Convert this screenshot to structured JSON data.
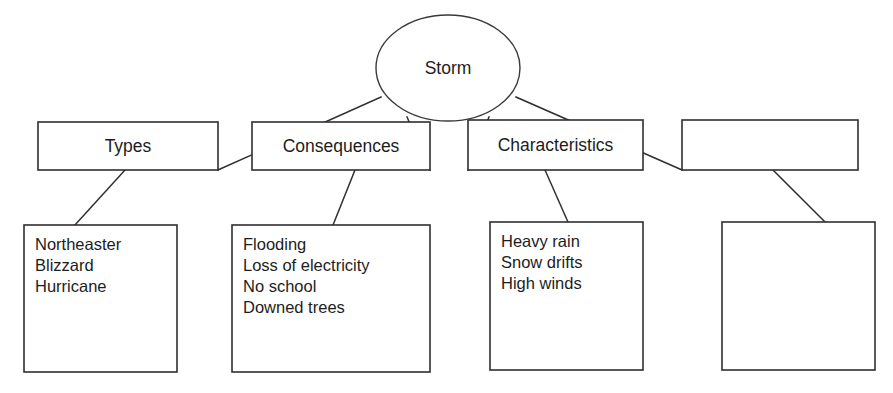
{
  "diagram": {
    "type": "concept-map",
    "title_node": {
      "label": "Storm",
      "shape": "ellipse",
      "cx": 448,
      "cy": 68,
      "rx": 72,
      "ry": 53
    },
    "category_boxes": [
      {
        "label": "Types",
        "x": 38,
        "y": 122,
        "w": 180,
        "h": 48
      },
      {
        "label": "Consequences",
        "x": 252,
        "y": 122,
        "w": 178,
        "h": 48
      },
      {
        "label": "Characteristics",
        "x": 468,
        "y": 120,
        "w": 175,
        "h": 50
      },
      {
        "label": "",
        "x": 682,
        "y": 120,
        "w": 176,
        "h": 50
      }
    ],
    "detail_boxes": [
      {
        "x": 24,
        "y": 225,
        "w": 153,
        "h": 147,
        "items": [
          "Northeaster",
          "Blizzard",
          "Hurricane"
        ]
      },
      {
        "x": 232,
        "y": 225,
        "w": 198,
        "h": 147,
        "items": [
          "Flooding",
          "Loss of electricity",
          "No school",
          "Downed trees"
        ]
      },
      {
        "x": 490,
        "y": 222,
        "w": 153,
        "h": 148,
        "items": [
          "Heavy rain",
          "Snow drifts",
          "High winds"
        ]
      },
      {
        "x": 722,
        "y": 222,
        "w": 153,
        "h": 148,
        "items": []
      }
    ],
    "connectors": [
      {
        "name": "storm-to-types",
        "x1": 381,
        "y1": 97,
        "x2": 218,
        "y2": 170
      },
      {
        "name": "storm-to-consequences",
        "x1": 407,
        "y1": 117,
        "x2": 430,
        "y2": 170
      },
      {
        "name": "storm-to-characteristics",
        "x1": 489,
        "y1": 117,
        "x2": 468,
        "y2": 170
      },
      {
        "name": "storm-to-fourth-category",
        "x1": 516,
        "y1": 97,
        "x2": 682,
        "y2": 170
      },
      {
        "name": "types-to-details",
        "x1": 125,
        "y1": 170,
        "x2": 75,
        "y2": 225
      },
      {
        "name": "consequences-to-details",
        "x1": 355,
        "y1": 170,
        "x2": 333,
        "y2": 225
      },
      {
        "name": "characteristics-to-details",
        "x1": 545,
        "y1": 170,
        "x2": 568,
        "y2": 222
      },
      {
        "name": "fourth-category-to-details",
        "x1": 773,
        "y1": 170,
        "x2": 825,
        "y2": 222
      }
    ],
    "colors": {
      "stroke": "#2f2f2f",
      "text": "#1d1d1d",
      "background": "#ffffff"
    }
  }
}
